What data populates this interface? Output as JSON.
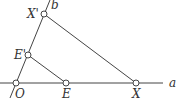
{
  "diagram": {
    "colors": {
      "line": "#444444",
      "point_fill": "#ffffff",
      "label": "#333333"
    },
    "lines": {
      "a": {
        "label": "a",
        "x1": 0,
        "y1": 83,
        "x2": 163,
        "y2": 83
      },
      "b": {
        "label": "b",
        "x1": 10,
        "y1": 98,
        "x2": 50,
        "y2": 0
      }
    },
    "segments": [
      {
        "from": "E'",
        "to": "E"
      },
      {
        "from": "X'",
        "to": "X"
      }
    ],
    "points": {
      "O": {
        "label": "O",
        "x": 16,
        "y": 83
      },
      "E": {
        "label": "E",
        "x": 66,
        "y": 83
      },
      "X": {
        "label": "X",
        "x": 136,
        "y": 83
      },
      "E1": {
        "label": "E'",
        "x": 28,
        "y": 55
      },
      "X1": {
        "label": "X'",
        "x": 44,
        "y": 14
      }
    }
  }
}
